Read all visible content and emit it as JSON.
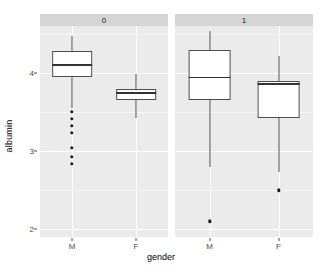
{
  "chart_data": {
    "type": "box",
    "title": "",
    "xlabel": "gender",
    "ylabel": "albumin",
    "ylim": [
      1.9,
      4.6
    ],
    "yticks": [
      4,
      3,
      2
    ],
    "ytick_labels": [
      "4",
      "3",
      "2"
    ],
    "grid": true,
    "legend": "none",
    "facet_variable": "",
    "facets": [
      {
        "label": "0",
        "groups": [
          {
            "category": "M",
            "whisker_low": 3.55,
            "q1": 3.95,
            "median": 4.1,
            "q3": 4.28,
            "whisker_high": 4.47,
            "outliers": [
              3.5,
              3.41,
              3.32,
              3.23,
              3.04,
              2.93,
              2.84
            ]
          },
          {
            "category": "F",
            "whisker_low": 3.42,
            "q1": 3.65,
            "median": 3.74,
            "q3": 3.8,
            "whisker_high": 3.99,
            "outliers": []
          }
        ]
      },
      {
        "label": "1",
        "groups": [
          {
            "category": "M",
            "whisker_low": 2.8,
            "q1": 3.65,
            "median": 3.94,
            "q3": 4.29,
            "whisker_high": 4.53,
            "outliers": [
              2.1
            ]
          },
          {
            "category": "F",
            "whisker_low": 2.73,
            "q1": 3.42,
            "median": 3.86,
            "q3": 3.9,
            "whisker_high": 4.22,
            "outliers": [
              2.5
            ]
          }
        ]
      }
    ]
  },
  "axis": {
    "y_title": "albumin",
    "x_title": "gender",
    "y_tick_0": "4",
    "y_tick_1": "3",
    "y_tick_2": "2",
    "x_tick_m": "M",
    "x_tick_f": "F"
  },
  "strips": {
    "left": "0",
    "right": "1"
  },
  "colors": {
    "panel_background": "#ebebeb",
    "strip_background": "#d5d5d5",
    "grid_major": "#ffffff",
    "box_fill": "#ffffff",
    "box_stroke": "#4d4d4d",
    "median_stroke": "#333333",
    "outlier_fill": "#1a1a1a",
    "text": "#4d4d4d"
  }
}
